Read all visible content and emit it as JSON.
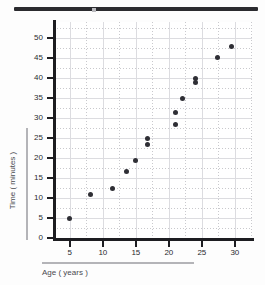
{
  "header": {
    "title_strip_color": "#2b2b2f"
  },
  "chart_data": {
    "type": "scatter",
    "title": "",
    "xlabel": "Age ( years )",
    "ylabel": "Time ( minutes )",
    "xlim": [
      2.6,
      32.6
    ],
    "ylim": [
      0,
      54
    ],
    "xticks": [
      5,
      10,
      15,
      20,
      25,
      30
    ],
    "yticks": [
      0,
      5,
      10,
      15,
      20,
      25,
      30,
      35,
      40,
      45,
      50
    ],
    "grid": true,
    "legend": "none",
    "marker_color": "#2f2f35",
    "points": [
      {
        "x": 5.0,
        "y": 5.0
      },
      {
        "x": 8.2,
        "y": 11.0
      },
      {
        "x": 11.5,
        "y": 12.5
      },
      {
        "x": 13.6,
        "y": 16.6
      },
      {
        "x": 15.0,
        "y": 19.5
      },
      {
        "x": 16.8,
        "y": 25.0
      },
      {
        "x": 16.8,
        "y": 23.4
      },
      {
        "x": 21.0,
        "y": 31.5
      },
      {
        "x": 21.0,
        "y": 28.4
      },
      {
        "x": 22.0,
        "y": 35.0
      },
      {
        "x": 24.0,
        "y": 39.9
      },
      {
        "x": 24.0,
        "y": 38.8
      },
      {
        "x": 27.3,
        "y": 45.2
      },
      {
        "x": 29.5,
        "y": 48.0
      }
    ]
  }
}
